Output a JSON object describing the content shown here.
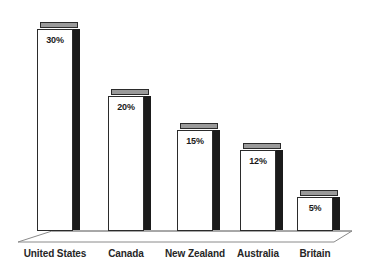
{
  "chart_data": {
    "type": "bar",
    "title": "",
    "subtitle": "",
    "xlabel": "",
    "ylabel": "",
    "categories": [
      "United States",
      "Canada",
      "New Zealand",
      "Australia",
      "Britain"
    ],
    "values": [
      30,
      20,
      15,
      12,
      5
    ],
    "value_labels": [
      "30%",
      "20%",
      "15%",
      "12%",
      "5%"
    ],
    "ylim": [
      0,
      33
    ],
    "grid": false,
    "legend": null,
    "legend_position": "none",
    "annotations": [],
    "style": {
      "background": "#ffffff",
      "bar_face": "#ffffff",
      "bar_outline": "#2b2b2b",
      "bar_top_face": "#9a9a9a",
      "bar_side_face": "#1b1b1b",
      "floor_outline": "#8a8a8a",
      "floor_face": "#ffffff",
      "label_color": "#262626",
      "value_color": "#1a1a1a"
    }
  }
}
